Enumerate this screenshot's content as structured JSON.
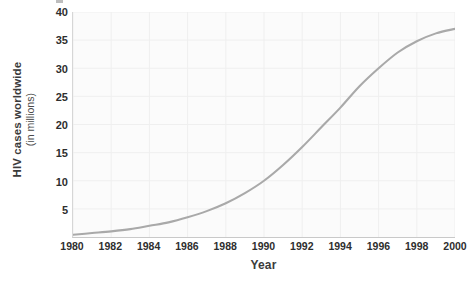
{
  "chart_data": {
    "type": "line",
    "title": "",
    "xlabel": "Year",
    "ylabel": "HIV cases worldwide (in millions)",
    "ylabel_main": "HIV cases worldwide",
    "ylabel_sub": "(in millions)",
    "x": [
      1980,
      1981,
      1982,
      1983,
      1984,
      1985,
      1986,
      1987,
      1988,
      1989,
      1990,
      1991,
      1992,
      1993,
      1994,
      1995,
      1996,
      1997,
      1998,
      1999,
      2000
    ],
    "values": [
      0.4,
      0.7,
      1.0,
      1.4,
      2.0,
      2.6,
      3.5,
      4.6,
      6.0,
      7.8,
      10.0,
      12.8,
      16.0,
      19.5,
      23.0,
      26.8,
      30.0,
      32.8,
      34.8,
      36.2,
      37.0
    ],
    "series": [
      {
        "name": "HIV cases worldwide",
        "color": "#a9a9a9",
        "values": [
          0.4,
          0.7,
          1.0,
          1.4,
          2.0,
          2.6,
          3.5,
          4.6,
          6.0,
          7.8,
          10.0,
          12.8,
          16.0,
          19.5,
          23.0,
          26.8,
          30.0,
          32.8,
          34.8,
          36.2,
          37.0
        ]
      }
    ],
    "xticks": [
      "1980",
      "1982",
      "1984",
      "1986",
      "1988",
      "1990",
      "1992",
      "1994",
      "1996",
      "1998",
      "2000"
    ],
    "xtick_values": [
      1980,
      1982,
      1984,
      1986,
      1988,
      1990,
      1992,
      1994,
      1996,
      1998,
      2000
    ],
    "yticks": [
      "5",
      "10",
      "15",
      "20",
      "25",
      "30",
      "35",
      "40"
    ],
    "ytick_values": [
      5,
      10,
      15,
      20,
      25,
      30,
      35,
      40
    ],
    "xlim": [
      1980,
      2000
    ],
    "ylim": [
      0,
      40
    ],
    "grid": true,
    "grid_color": "#efefef",
    "legend": false,
    "legend_position": "none",
    "plot_background": "#fbfbfb",
    "axis_color": "#cccccc",
    "text_color": "#2e2e2e"
  }
}
